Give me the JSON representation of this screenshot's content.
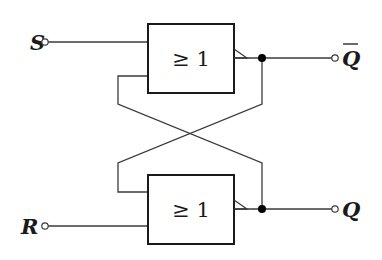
{
  "diagram": {
    "type": "RS flip-flop (NOR latch)",
    "gates": [
      {
        "id": "gate-top",
        "label": "≥ 1"
      },
      {
        "id": "gate-bottom",
        "label": "≥ 1"
      }
    ],
    "inputs": [
      {
        "id": "S",
        "label": "S"
      },
      {
        "id": "R",
        "label": "R"
      }
    ],
    "outputs": [
      {
        "id": "Q_bar",
        "label": "Q",
        "overline": true
      },
      {
        "id": "Q",
        "label": "Q",
        "overline": false
      }
    ],
    "colors": {
      "wire": "#3a3a3a",
      "gate_border": "#1a1a1a",
      "junction": "#000000",
      "background": "#ffffff"
    }
  }
}
